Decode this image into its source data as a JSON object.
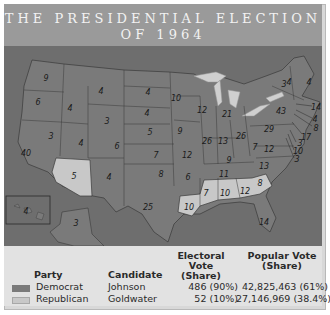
{
  "title": {
    "line1": "THE PRESIDENTIAL ELECTION",
    "line2": "OF 1964"
  },
  "colors": {
    "democrat": "#7a7a7a",
    "republican": "#c8c8c8",
    "water": "#6e6e6e",
    "lakes": "#cfcfcf",
    "title_bg": "#9a9a9a",
    "legend_bg": "#e2e2e2"
  },
  "map": {
    "states": [
      {
        "name": "Washington",
        "ev": "9",
        "party": "democrat",
        "x": 42,
        "y": 32
      },
      {
        "name": "Oregon",
        "ev": "6",
        "party": "democrat",
        "x": 34,
        "y": 56
      },
      {
        "name": "California",
        "ev": "40",
        "party": "democrat",
        "x": 22,
        "y": 107
      },
      {
        "name": "Idaho",
        "ev": "4",
        "party": "democrat",
        "x": 66,
        "y": 62
      },
      {
        "name": "Nevada",
        "ev": "3",
        "party": "democrat",
        "x": 47,
        "y": 90
      },
      {
        "name": "Montana",
        "ev": "4",
        "party": "democrat",
        "x": 97,
        "y": 45
      },
      {
        "name": "Wyoming",
        "ev": "3",
        "party": "democrat",
        "x": 103,
        "y": 75
      },
      {
        "name": "Utah",
        "ev": "4",
        "party": "democrat",
        "x": 77,
        "y": 97
      },
      {
        "name": "Colorado",
        "ev": "6",
        "party": "democrat",
        "x": 113,
        "y": 100
      },
      {
        "name": "Arizona",
        "ev": "5",
        "party": "republican",
        "x": 70,
        "y": 130
      },
      {
        "name": "New Mexico",
        "ev": "4",
        "party": "democrat",
        "x": 105,
        "y": 131
      },
      {
        "name": "North Dakota",
        "ev": "4",
        "party": "democrat",
        "x": 144,
        "y": 46
      },
      {
        "name": "South Dakota",
        "ev": "4",
        "party": "democrat",
        "x": 143,
        "y": 67
      },
      {
        "name": "Nebraska",
        "ev": "5",
        "party": "democrat",
        "x": 146,
        "y": 86
      },
      {
        "name": "Kansas",
        "ev": "7",
        "party": "democrat",
        "x": 152,
        "y": 109
      },
      {
        "name": "Oklahoma",
        "ev": "8",
        "party": "democrat",
        "x": 157,
        "y": 128
      },
      {
        "name": "Texas",
        "ev": "25",
        "party": "democrat",
        "x": 144,
        "y": 161
      },
      {
        "name": "Minnesota",
        "ev": "10",
        "party": "democrat",
        "x": 172,
        "y": 52
      },
      {
        "name": "Iowa",
        "ev": "9",
        "party": "democrat",
        "x": 176,
        "y": 85
      },
      {
        "name": "Missouri",
        "ev": "12",
        "party": "democrat",
        "x": 183,
        "y": 109
      },
      {
        "name": "Arkansas",
        "ev": "6",
        "party": "democrat",
        "x": 184,
        "y": 131
      },
      {
        "name": "Louisiana",
        "ev": "10",
        "party": "republican",
        "x": 185,
        "y": 161
      },
      {
        "name": "Wisconsin",
        "ev": "12",
        "party": "democrat",
        "x": 198,
        "y": 64
      },
      {
        "name": "Illinois",
        "ev": "26",
        "party": "democrat",
        "x": 203,
        "y": 95
      },
      {
        "name": "Michigan",
        "ev": "21",
        "party": "democrat",
        "x": 223,
        "y": 68
      },
      {
        "name": "Indiana",
        "ev": "13",
        "party": "democrat",
        "x": 219,
        "y": 95
      },
      {
        "name": "Ohio",
        "ev": "26",
        "party": "democrat",
        "x": 237,
        "y": 90
      },
      {
        "name": "Kentucky",
        "ev": "9",
        "party": "democrat",
        "x": 225,
        "y": 114
      },
      {
        "name": "Tennessee",
        "ev": "11",
        "party": "democrat",
        "x": 220,
        "y": 128
      },
      {
        "name": "Mississippi",
        "ev": "7",
        "party": "republican",
        "x": 202,
        "y": 147
      },
      {
        "name": "Alabama",
        "ev": "10",
        "party": "republican",
        "x": 221,
        "y": 147
      },
      {
        "name": "Georgia",
        "ev": "12",
        "party": "republican",
        "x": 241,
        "y": 145
      },
      {
        "name": "South Carolina",
        "ev": "8",
        "party": "republican",
        "x": 256,
        "y": 137
      },
      {
        "name": "Florida",
        "ev": "14",
        "party": "democrat",
        "x": 260,
        "y": 176
      },
      {
        "name": "North Carolina",
        "ev": "13",
        "party": "democrat",
        "x": 260,
        "y": 120
      },
      {
        "name": "Virginia",
        "ev": "12",
        "party": "democrat",
        "x": 265,
        "y": 103
      },
      {
        "name": "West Virginia",
        "ev": "7",
        "party": "democrat",
        "x": 251,
        "y": 101
      },
      {
        "name": "Pennsylvania",
        "ev": "29",
        "party": "democrat",
        "x": 265,
        "y": 83
      },
      {
        "name": "New York",
        "ev": "43",
        "party": "democrat",
        "x": 277,
        "y": 65
      },
      {
        "name": "Vermont",
        "ev": "3",
        "party": "democrat",
        "x": 280,
        "y": 38
      },
      {
        "name": "New Hampshire",
        "ev": "4",
        "party": "democrat",
        "x": 285,
        "y": 36
      },
      {
        "name": "Maine",
        "ev": "4",
        "party": "democrat",
        "x": 305,
        "y": 36
      },
      {
        "name": "Massachusetts",
        "ev": "14",
        "party": "democrat",
        "x": 312,
        "y": 61
      },
      {
        "name": "Rhode Island",
        "ev": "4",
        "party": "democrat",
        "x": 311,
        "y": 73
      },
      {
        "name": "Connecticut",
        "ev": "8",
        "party": "democrat",
        "x": 312,
        "y": 82
      },
      {
        "name": "New Jersey",
        "ev": "17",
        "party": "democrat",
        "x": 302,
        "y": 91
      },
      {
        "name": "Delaware",
        "ev": "3",
        "party": "democrat",
        "x": 296,
        "y": 97
      },
      {
        "name": "Maryland",
        "ev": "10",
        "party": "democrat",
        "x": 294,
        "y": 105
      },
      {
        "name": "District of Columbia",
        "ev": "3",
        "party": "democrat",
        "x": 293,
        "y": 113
      },
      {
        "name": "Hawaii",
        "ev": "4",
        "party": "democrat",
        "x": 22,
        "y": 165
      },
      {
        "name": "Alaska",
        "ev": "3",
        "party": "democrat",
        "x": 72,
        "y": 177
      }
    ]
  },
  "legend": {
    "headers": {
      "party": "Party",
      "candidate": "Candidate",
      "electoral_line1": "Electoral Vote",
      "electoral_line2": "(Share)",
      "popular_line1": "Popular Vote",
      "popular_line2": "(Share)"
    },
    "rows": [
      {
        "party": "Democrat",
        "candidate": "Johnson",
        "electoral": "486 (90%)",
        "popular": "42,825,463 (61%)"
      },
      {
        "party": "Republican",
        "candidate": "Goldwater",
        "electoral": "52 (10%)",
        "popular": "27,146,969 (38.4%)"
      }
    ]
  }
}
